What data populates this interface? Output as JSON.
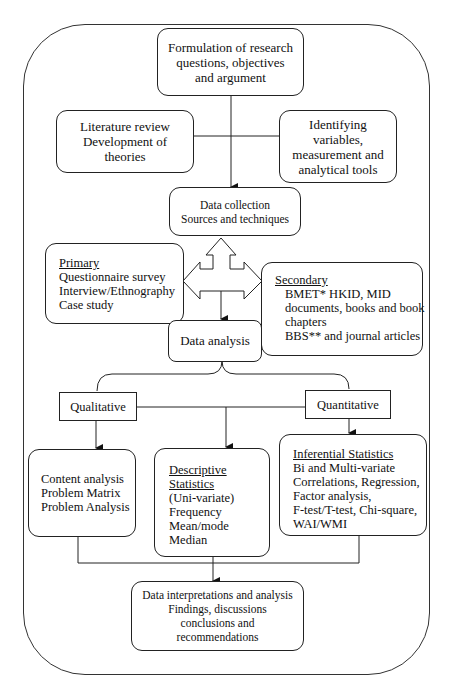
{
  "diagram": {
    "type": "flowchart",
    "title": "",
    "nodes": {
      "formulation": {
        "lines": [
          "Formulation of research",
          "questions, objectives",
          "and argument"
        ]
      },
      "literature": {
        "lines": [
          "Literature review",
          "Development of",
          "theories"
        ]
      },
      "identifying": {
        "lines": [
          "Identifying",
          "variables,",
          "measurement and",
          "analytical tools"
        ]
      },
      "data_collection": {
        "lines": [
          "Data collection",
          "Sources and techniques"
        ]
      },
      "primary": {
        "heading": "Primary",
        "lines": [
          "Questionnaire survey",
          "Interview/Ethnography",
          "Case study"
        ]
      },
      "secondary": {
        "heading": "Secondary",
        "lines": [
          "BMET* HKID, MID",
          "documents, books and book",
          "chapters",
          "BBS** and journal articles"
        ]
      },
      "data_analysis": {
        "lines": [
          "Data analysis"
        ]
      },
      "qualitative": {
        "lines": [
          "Qualitative"
        ]
      },
      "quantitative": {
        "lines": [
          "Quantitative"
        ]
      },
      "content": {
        "lines": [
          "Content analysis",
          "Problem Matrix",
          "Problem Analysis"
        ]
      },
      "descriptive": {
        "heading_lines": [
          "Descriptive",
          "Statistics"
        ],
        "lines": [
          "(Uni-variate)",
          "Frequency",
          "Mean/mode",
          "Median"
        ]
      },
      "inferential": {
        "heading": "Inferential Statistics",
        "lines": [
          "Bi and Multi-variate",
          "Correlations, Regression,",
          "Factor analysis,",
          "F-test/T-test, Chi-square,",
          "WAI/WMI"
        ]
      },
      "final": {
        "lines": [
          "Data interpretations and analysis",
          "Findings, discussions",
          "conclusions and",
          "recommendations"
        ]
      }
    },
    "edges": [
      {
        "from": "formulation",
        "to": "data_collection",
        "style": "arrow"
      },
      {
        "from": "literature",
        "to": "identifying",
        "style": "line",
        "via": "formulation-stem"
      },
      {
        "from": "data_collection",
        "to": "primary",
        "style": "block-double-arrow"
      },
      {
        "from": "data_collection",
        "to": "secondary",
        "style": "block-double-arrow"
      },
      {
        "from": "primary",
        "to": "secondary",
        "style": "block-double-arrow"
      },
      {
        "from": "block-arrow",
        "to": "data_analysis",
        "style": "arrow"
      },
      {
        "from": "data_analysis",
        "to": "qualitative",
        "style": "brace"
      },
      {
        "from": "data_analysis",
        "to": "quantitative",
        "style": "brace"
      },
      {
        "from": "qualitative",
        "to": "content",
        "style": "arrow"
      },
      {
        "from": "qualitative",
        "to": "descriptive",
        "style": "arrow",
        "via": "qual-quant-connector"
      },
      {
        "from": "quantitative",
        "to": "inferential",
        "style": "arrow"
      },
      {
        "from": "content",
        "to": "final",
        "style": "arrow",
        "via": "bottom-bracket"
      },
      {
        "from": "descriptive",
        "to": "final",
        "style": "arrow"
      },
      {
        "from": "inferential",
        "to": "final",
        "style": "arrow",
        "via": "bottom-bracket"
      }
    ],
    "colors": {
      "stroke": "#222222",
      "background": "#ffffff",
      "text": "#111111"
    }
  }
}
